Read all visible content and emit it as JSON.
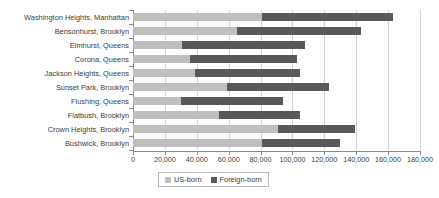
{
  "chart_data": {
    "type": "bar",
    "orientation": "horizontal",
    "stacked": true,
    "title": "",
    "subtitle": "",
    "xlabel": "",
    "ylabel": "",
    "xlim": [
      0,
      180000
    ],
    "grid": true,
    "legend_position": "bottom",
    "categories": [
      "Washington Heights, Manhattan",
      "Bensonhurst, Brooklyn",
      "Elmhurst, Queens",
      "Corona, Queens",
      "Jackson Heights, Queens",
      "Sunset Park, Brooklyn",
      "Flushing, Queens",
      "Flatbush, Brooklyn",
      "Crown Heights, Brooklyn",
      "Bushwick, Brooklyn"
    ],
    "series": [
      {
        "name": "US-born",
        "color": "#bfbfbf",
        "values": [
          81000,
          65000,
          31000,
          36000,
          39000,
          59000,
          30000,
          54000,
          91000,
          81000
        ]
      },
      {
        "name": "Foreign-born",
        "color": "#595959",
        "values": [
          82000,
          78000,
          77000,
          67000,
          66000,
          64000,
          64000,
          51000,
          48000,
          49000
        ]
      }
    ],
    "totals": [
      163000,
      143000,
      108000,
      103000,
      105000,
      123000,
      94000,
      105000,
      139000,
      130000
    ],
    "xticks": [
      0,
      20000,
      40000,
      60000,
      80000,
      100000,
      120000,
      140000,
      160000,
      180000
    ],
    "xtick_labels": [
      "0",
      "20,000",
      "40,000",
      "60,000",
      "80,000",
      "100,000",
      "120,000",
      "140,000",
      "160,000",
      "180,000"
    ]
  },
  "legend": {
    "items": [
      {
        "label": "US-born",
        "color": "#bfbfbf"
      },
      {
        "label": "Foreign-born",
        "color": "#595959"
      }
    ]
  },
  "colors": {
    "us_born": "#bfbfbf",
    "foreign_born": "#595959",
    "axis": "#8a8a8a",
    "gridline": "#d4d4d4",
    "text": "#3b3b3b",
    "background": "#ffffff"
  }
}
